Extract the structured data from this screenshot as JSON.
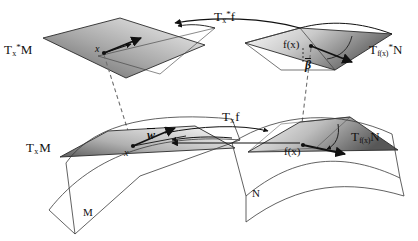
{
  "figure": {
    "canvas": {
      "width": 418,
      "height": 241,
      "background": "#ffffff"
    },
    "colors": {
      "ink": "#111111",
      "plane_fill_dark": "#6f6f6f",
      "plane_fill_light": "#f2f2f2",
      "dashed": "#777777"
    },
    "labels": {
      "cotangent_space_M": {
        "base": "T",
        "sub": "x",
        "sup": "*",
        "tail": "M",
        "text": "T*xM"
      },
      "cotangent_map": {
        "base": "T",
        "sub": "x",
        "sup": "*",
        "tail": "f",
        "text": "T*xf"
      },
      "cotangent_space_N": {
        "base": "T",
        "sub": "f(x)",
        "sup": "*",
        "tail": "N",
        "text": "T*f(x)N"
      },
      "tangent_space_M": {
        "base": "T",
        "sub": "x",
        "sup": "",
        "tail": "M",
        "text": "TxM"
      },
      "tangent_map": {
        "base": "T",
        "sub": "x",
        "sup": "",
        "tail": "f",
        "text": "Txf"
      },
      "tangent_space_N": {
        "base": "T",
        "sub": "f(x)",
        "sup": "",
        "tail": "N",
        "text": "Tf(x)N"
      },
      "point_x_upper": "x",
      "point_x_lower": "x",
      "point_fx_upper": "f(x)",
      "point_fx_lower": "f(x)",
      "covector_beta": "β",
      "vector_w": "w",
      "manifold_M": "M",
      "manifold_N": "N"
    },
    "elements": {
      "planes": [
        {
          "name": "cotangent-plane-M",
          "position": "upper-left"
        },
        {
          "name": "cotangent-plane-N",
          "position": "upper-right"
        },
        {
          "name": "tangent-plane-M",
          "position": "lower-left"
        },
        {
          "name": "tangent-plane-N",
          "position": "lower-right"
        }
      ],
      "surfaces": [
        {
          "name": "manifold-M-surface",
          "label": "M"
        },
        {
          "name": "manifold-N-surface",
          "label": "N"
        }
      ],
      "dashed_connectors": 2,
      "arrows": [
        "cotangent-map-arrow",
        "tangent-map-arrow",
        "covector-beta-arrow",
        "vector-w-arrow",
        "pullback-arrow-upper",
        "pushforward-arrow-lower"
      ]
    }
  }
}
